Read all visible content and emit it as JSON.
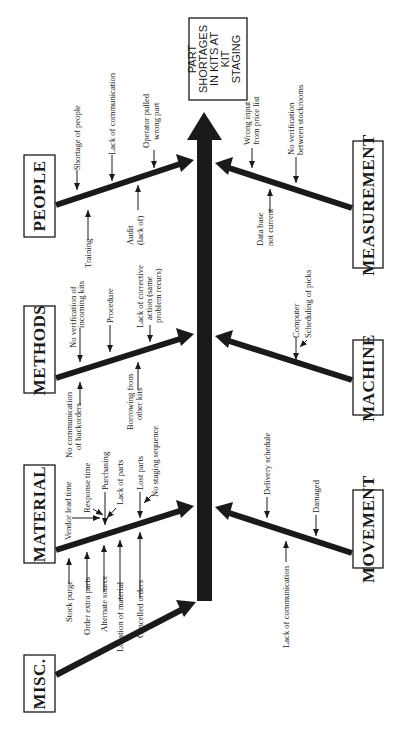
{
  "diagram": {
    "type": "fishbone",
    "orientation": "rotated-90-ccw",
    "effect": {
      "label": "effect-box",
      "lines": [
        "PART",
        "SHORTAGES",
        "IN KITS AT",
        "KIT",
        "STAGING"
      ]
    },
    "categories": {
      "people": {
        "label": "PEOPLE",
        "causes": [
          "Shortage of people",
          "Training",
          "Lack of communication",
          "Audit",
          "(lack of)",
          "Operator pulled",
          "wrong part"
        ]
      },
      "methods": {
        "label": "METHODS",
        "causes": [
          "No verification of",
          "incoming kits",
          "No communication",
          "of backorders",
          "Procedure",
          "Borrowing from",
          "other kits",
          "Lack of corrective",
          "action (same",
          "problem recurs)"
        ]
      },
      "material": {
        "label": "MATERIAL",
        "causes": [
          "Stock purge",
          "Order extra parts",
          "Vendor lead time",
          "Response time",
          "Alternate source",
          "Purchasing",
          "Location of material",
          "Lack of parts",
          "Cancelled orders",
          "Lost parts",
          "No staging sequence"
        ]
      },
      "misc": {
        "label": "MISC.",
        "causes": []
      },
      "measurement": {
        "label": "MEASUREMENT",
        "causes": [
          "Wrong input",
          "from price list",
          "No verification",
          "between stockrooms",
          "Data base",
          "not current"
        ]
      },
      "machine": {
        "label": "MACHINE",
        "causes": [
          "Computer",
          "Scheduling of picks"
        ]
      },
      "movement": {
        "label": "MOVEMENT",
        "causes": [
          "Delivery schedule",
          "Damaged",
          "Lack of communication"
        ]
      }
    },
    "colors": {
      "ink": "#1a1a1a",
      "background": "#ffffff"
    }
  }
}
